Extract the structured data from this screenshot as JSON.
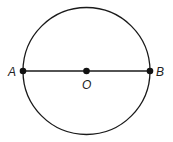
{
  "diagram": {
    "type": "circle-with-diameter",
    "circle": {
      "cx": 86.5,
      "cy": 71,
      "r": 63.5,
      "stroke": "#1a1a1a"
    },
    "diameter": {
      "from": "A",
      "to": "B",
      "stroke": "#1a1a1a"
    },
    "points": [
      {
        "id": "A",
        "label": "A",
        "x": 23,
        "y": 71
      },
      {
        "id": "O",
        "label": "O",
        "x": 86.5,
        "y": 71
      },
      {
        "id": "B",
        "label": "B",
        "x": 150,
        "y": 71
      }
    ]
  }
}
